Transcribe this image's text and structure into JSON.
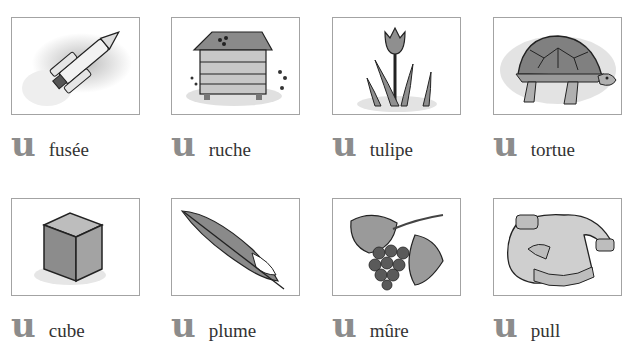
{
  "page": {
    "title": "",
    "letter_color": "#8c8c8c",
    "frame_border_color": "#a3a3a3"
  },
  "cards": [
    {
      "letter": "u",
      "word": "fusée",
      "image": "rocket-illustration"
    },
    {
      "letter": "u",
      "word": "ruche",
      "image": "beehive-illustration"
    },
    {
      "letter": "u",
      "word": "tulipe",
      "image": "tulip-illustration"
    },
    {
      "letter": "u",
      "word": "tortue",
      "image": "turtle-illustration"
    },
    {
      "letter": "u",
      "word": "cube",
      "image": "cube-illustration"
    },
    {
      "letter": "u",
      "word": "plume",
      "image": "feather-illustration"
    },
    {
      "letter": "u",
      "word": "mûre",
      "image": "blackberry-illustration"
    },
    {
      "letter": "u",
      "word": "pull",
      "image": "sweater-illustration"
    }
  ]
}
